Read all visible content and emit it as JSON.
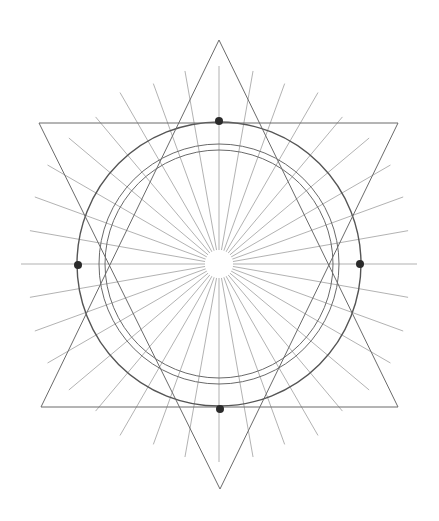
{
  "drawing": {
    "title": "Hexagram with radiating lines and concentric circles",
    "background": "#ffffff",
    "stroke_color": "#6a6a6a",
    "ray_color": "#9a9a9a",
    "dot_color": "#2b2b2b",
    "center": [
      219,
      264
    ],
    "outer_circle_radius": 142,
    "inner_circle_radii": [
      120,
      114
    ],
    "center_hole_radius": 14,
    "rays": {
      "count": 36,
      "step_degrees": 10,
      "inner_radius": 14,
      "outer_radius": 196
    },
    "triangle_up": [
      [
        219,
        40
      ],
      [
        398,
        407
      ],
      [
        41,
        407
      ]
    ],
    "triangle_down": [
      [
        39,
        123
      ],
      [
        398,
        123
      ],
      [
        220,
        489
      ]
    ],
    "dots": [
      {
        "name": "top",
        "x": 219,
        "y": 121
      },
      {
        "name": "bottom",
        "x": 220,
        "y": 409
      },
      {
        "name": "left",
        "x": 78,
        "y": 265
      },
      {
        "name": "right",
        "x": 360,
        "y": 264
      }
    ]
  }
}
